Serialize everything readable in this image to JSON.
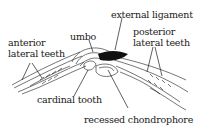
{
  "diagram": {
    "labels": {
      "umbo": "umbo",
      "external_ligament": "external ligament",
      "anterior_line1": "anterior",
      "anterior_line2": "lateral teeth",
      "posterior_line1": "posterior",
      "posterior_line2": "lateral teeth",
      "cardinal_tooth": "cardinal tooth",
      "recessed_chondrophore": "recessed chondrophore"
    },
    "colors": {
      "ink": "#1a1a1a",
      "ligament": "#111111",
      "background": "#ffffff"
    }
  }
}
